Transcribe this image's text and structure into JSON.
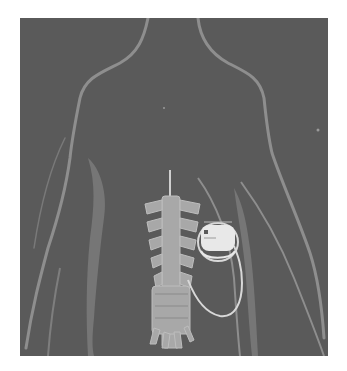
{
  "figure": {
    "colors": {
      "background": "#5a5a5a",
      "body_outline": "#8e8e8e",
      "body_shadow": "#767676",
      "spine": "#a8a8a8",
      "device": "#e8e8e8",
      "lead": "#d8d8d8",
      "page": "#ffffff"
    },
    "elements": [
      "body-outline",
      "spine",
      "lead-catheter",
      "implanted-device"
    ]
  }
}
